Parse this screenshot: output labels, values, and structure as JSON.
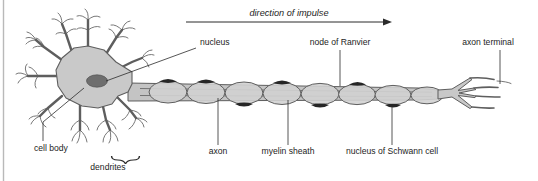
{
  "diagram": {
    "impulse": {
      "label": "direction of impulse",
      "arrow_from_x": 186,
      "arrow_to_x": 392,
      "arrow_y": 22
    },
    "labels": [
      {
        "id": "nucleus",
        "text": "nucleus",
        "x": 200,
        "y": 45,
        "anchor": "start"
      },
      {
        "id": "node-of-ranvier",
        "text": "node of Ranvier",
        "x": 340,
        "y": 45,
        "anchor": "middle"
      },
      {
        "id": "axon-terminal",
        "text": "axon terminal",
        "x": 488,
        "y": 45,
        "anchor": "middle"
      },
      {
        "id": "cell-body",
        "text": "cell body",
        "x": 34,
        "y": 151,
        "anchor": "start"
      },
      {
        "id": "dendrites",
        "text": "dendrites",
        "x": 108,
        "y": 170,
        "anchor": "middle"
      },
      {
        "id": "axon",
        "text": "axon",
        "x": 218,
        "y": 154,
        "anchor": "middle"
      },
      {
        "id": "myelin-sheath",
        "text": "myelin sheath",
        "x": 288,
        "y": 154,
        "anchor": "middle"
      },
      {
        "id": "schwann-nucleus",
        "text": "nucleus of Schwann cell",
        "x": 392,
        "y": 154,
        "anchor": "middle"
      }
    ],
    "colors": {
      "soma_fill": "#c9c9c9",
      "nucleus_fill": "#6e6e6e",
      "myelin_fill": "#d2d2d2",
      "axon_fill": "#c4c4c4",
      "schwann_nucleus_fill": "#262626",
      "outline": "#5e5e5e",
      "text": "#1d1d1d",
      "frame_line": "#b9b9b9",
      "background": "#ffffff"
    },
    "parts": {
      "soma_label": "cell body (soma)",
      "nucleus_label": "cell nucleus",
      "axon_label": "axon fibre",
      "myelin_segment_label": "myelin segment",
      "schwann_nucleus_label": "Schwann cell nucleus",
      "node_label": "node of Ranvier gap",
      "terminal_label": "axon terminal branch",
      "dendrite_label": "dendrite branch"
    },
    "counts": {
      "myelin_segments": 8,
      "dendrite_stems": 8,
      "terminal_branches": 4
    }
  }
}
